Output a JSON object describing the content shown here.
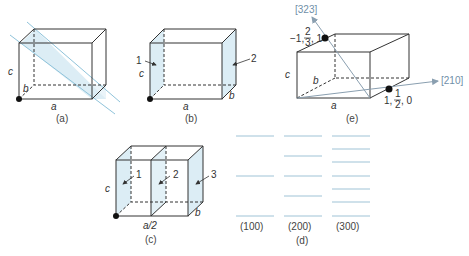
{
  "panels": {
    "a": {
      "caption": "(a)",
      "edge_a": "a",
      "edge_b": "b",
      "edge_c": "c"
    },
    "b": {
      "caption": "(b)",
      "edge_a": "a",
      "edge_b": "b",
      "edge_c": "c",
      "plane1": "1",
      "plane2": "2"
    },
    "c": {
      "caption": "(c)",
      "edge_a": "a/2",
      "edge_b": "b",
      "edge_c": "c",
      "plane1": "1",
      "plane2": "2",
      "plane3": "3"
    },
    "d": {
      "caption": "(d)",
      "labels": [
        "(100)",
        "(200)",
        "(300)"
      ]
    },
    "e": {
      "caption": "(e)",
      "edge_a": "a",
      "edge_b": "b",
      "edge_c": "c",
      "dir1": "[323]",
      "dir2": "[210]",
      "point1": {
        "x": "−1,",
        "num": "2",
        "den": "3",
        "z": ", 1"
      },
      "point2": {
        "x": "1,",
        "num": "1",
        "den": "2",
        "z": ", 0"
      }
    }
  },
  "colors": {
    "plane_fill": "#dcedf5",
    "plane_line": "#8fc3da",
    "edge": "#333333",
    "arrow": "#8a9fb0"
  }
}
